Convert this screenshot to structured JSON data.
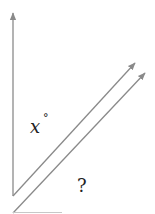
{
  "diagram": {
    "type": "geometry-angle-parallel-lines",
    "line_color": "#8a8a8a",
    "text_color": "#222222",
    "labels": {
      "angle_x": "x",
      "degree_symbol": "°",
      "unknown_angle": "?"
    },
    "elements": [
      {
        "name": "vertical-ray",
        "from": [
          13,
          196
        ],
        "to": [
          13,
          12
        ],
        "arrow": true
      },
      {
        "name": "diagonal-ray-upper",
        "from": [
          13,
          196
        ],
        "to": [
          136,
          62
        ],
        "arrow": true
      },
      {
        "name": "diagonal-ray-lower",
        "from": [
          13,
          213
        ],
        "to": [
          146,
          72
        ],
        "arrow": true
      },
      {
        "name": "base-line",
        "from": [
          13,
          212
        ],
        "to": [
          62,
          212
        ],
        "arrow": false
      }
    ]
  }
}
